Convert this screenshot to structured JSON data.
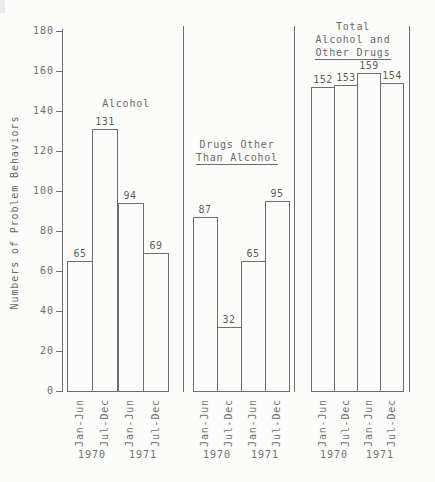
{
  "page": {
    "background": "#fcfcfb",
    "line_color": "#6e6e6e",
    "text_color": "#6f6f6f"
  },
  "chart_data": {
    "type": "bar",
    "style": "outlined white bars, scanned typewriter figure, three panels separated by vertical rules",
    "ylabel": "Numbers of Problem Behaviors",
    "ylim": [
      0,
      180
    ],
    "ytick_interval": 20,
    "yticks": [
      0,
      20,
      40,
      60,
      80,
      100,
      120,
      140,
      160,
      180
    ],
    "grid": false,
    "legend": "none",
    "groups": [
      {
        "name": "alcohol",
        "title_lines": [
          {
            "text": "Alcohol",
            "underline": false
          }
        ],
        "categories": [
          "Jan-Jun",
          "Jul-Dec",
          "Jan-Jun",
          "Jul-Dec"
        ],
        "values": [
          65,
          131,
          94,
          69
        ],
        "value_labels": [
          "65",
          "131",
          "94",
          "69"
        ],
        "years": [
          {
            "label": "1970",
            "under_bars": [
              0,
              1
            ]
          },
          {
            "label": "1971",
            "under_bars": [
              2,
              3
            ]
          }
        ]
      },
      {
        "name": "drugs-other-than-alcohol",
        "title_lines": [
          {
            "text": "Drugs Other",
            "underline": false
          },
          {
            "text": "Than Alcohol",
            "underline": true
          }
        ],
        "categories": [
          "Jan-Jun",
          "Jul-Dec",
          "Jan-Jun",
          "Jul-Dec"
        ],
        "values": [
          87,
          32,
          65,
          95
        ],
        "value_labels": [
          "87",
          "32",
          "65",
          "95"
        ],
        "years": [
          {
            "label": "1970",
            "under_bars": [
              0,
              1
            ]
          },
          {
            "label": "1971",
            "under_bars": [
              2,
              3
            ]
          }
        ]
      },
      {
        "name": "total-alcohol-and-other-drugs",
        "title_lines": [
          {
            "text": "Total",
            "underline": false
          },
          {
            "text": "Alcohol and",
            "underline": false
          },
          {
            "text": "Other Drugs",
            "underline": true
          }
        ],
        "categories": [
          "Jan-Jun",
          "Jul-Dec",
          "Jan-Jun",
          "Jul-Dec"
        ],
        "values": [
          152,
          153,
          159,
          154
        ],
        "value_labels": [
          "152",
          "153",
          "159",
          "154"
        ],
        "years": [
          {
            "label": "1970",
            "under_bars": [
              0,
              1
            ]
          },
          {
            "label": "1971",
            "under_bars": [
              2,
              3
            ]
          }
        ]
      }
    ]
  }
}
